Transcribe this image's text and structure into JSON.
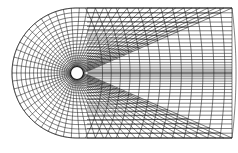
{
  "diagram": {
    "colors": {
      "line": "#1a1a1a",
      "background": "#ffffff",
      "cylinder_fill": "#ffffff"
    },
    "geometry": {
      "center": [
        77,
        73
      ],
      "cylinder_radius": 6.5,
      "outer_radius": 65,
      "right_edge_x": 232,
      "radial_lines": 40,
      "wrap_rings": 20,
      "wake_columns": 14,
      "wake_rows_each_side": 20
    }
  }
}
